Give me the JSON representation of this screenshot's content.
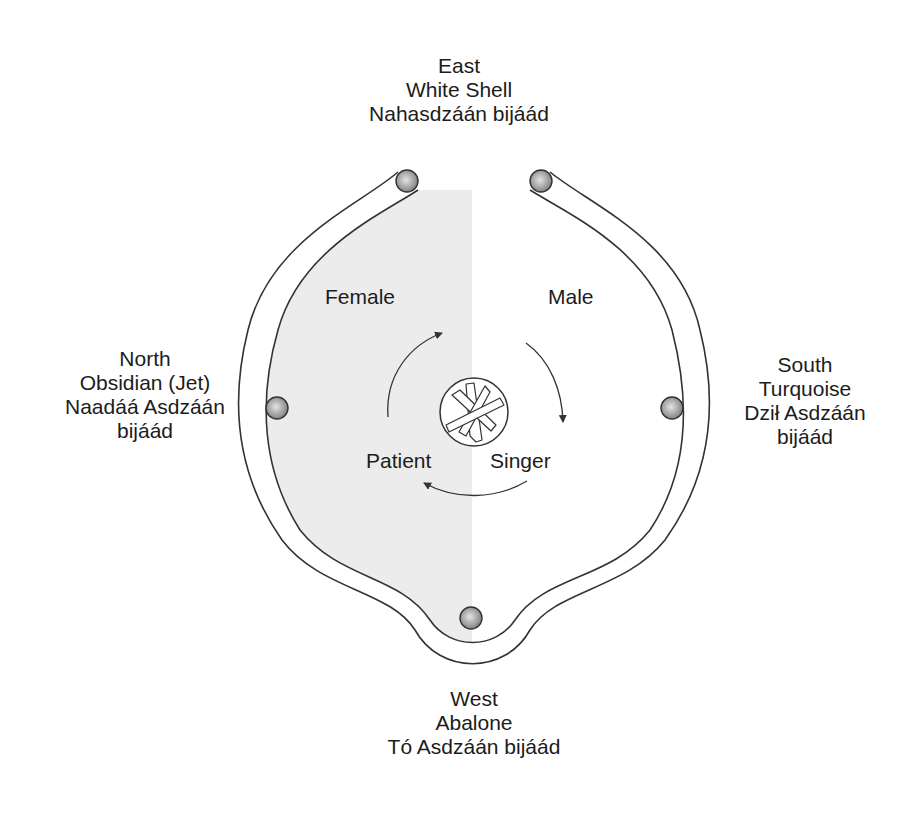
{
  "diagram": {
    "directions": {
      "east": {
        "lines": [
          "East",
          "White Shell",
          "Nahasdzáán bijáád"
        ]
      },
      "north": {
        "lines": [
          "North",
          "Obsidian (Jet)",
          "Naadáá Asdzáán",
          "bijáád"
        ]
      },
      "south": {
        "lines": [
          "South",
          "Turquoise",
          "Dził Asdzáán",
          "bijáád"
        ]
      },
      "west": {
        "lines": [
          "West",
          "Abalone",
          "Tó Asdzáán bijáád"
        ]
      }
    },
    "regions": {
      "female": "Female",
      "male": "Male"
    },
    "participants": {
      "patient": "Patient",
      "singer": "Singer"
    },
    "icons": {
      "center": "crossed-sticks-fire-icon",
      "bead": "shell-bead-icon",
      "arrow": "curved-arrow-icon"
    },
    "colors": {
      "line": "#333333",
      "female_shade": "#ececec",
      "bead_fill": "#b8b8b8",
      "text": "#1c1c1c"
    }
  }
}
